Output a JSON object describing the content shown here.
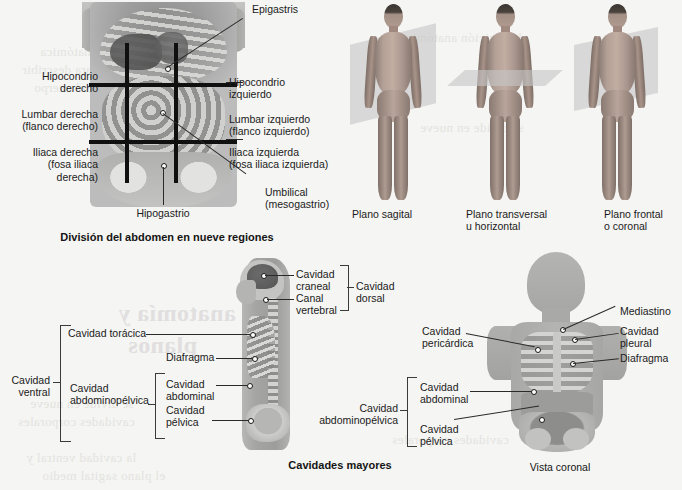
{
  "page": {
    "background_color": "#f5f5f3",
    "ghost_text": [
      "anatomía y",
      "planos",
      "la posición anatómica",
      "referencia para describir",
      "las regiones del cuerpo",
      "se divide en nueve",
      "cavidades corporales",
      "la cavidad ventral y",
      "el plano sagital medio"
    ]
  },
  "panel_abdomen": {
    "caption": "División del abdomen en nueve regiones",
    "labels": {
      "epigastris": "Epigastris",
      "hipocondrio_derecho": "Hipocondrio\nderecho",
      "lumbar_derecha": "Lumbar derecha\n(flanco derecho)",
      "iliaca_derecha": "Iliaca derecha\n(fosa iliaca\nderecha)",
      "hipocondrio_izquierdo": "Hipocondrio\nizquierdo",
      "lumbar_izquierdo": "Lumbar izquierdo\n(flanco izquierdo)",
      "iliaca_izquierda": "Iliaca izquierda\n(fosa iliaca izquierda)",
      "umbilical": "Umbilical\n(mesogastrio)",
      "hipogastrio": "Hipogastrio"
    }
  },
  "panel_planes": {
    "items": [
      {
        "label": "Plano sagital"
      },
      {
        "label": "Plano transversal\nu horizontal"
      },
      {
        "label": "Plano frontal\no coronal"
      }
    ]
  },
  "panel_cavities_lateral": {
    "caption": "Cavidades mayores",
    "labels": {
      "cavidad_ventral": "Cavidad\nventral",
      "cavidad_toracica": "Cavidad torácica",
      "cavidad_abdominopelvica": "Cavidad\nabdominopélvica",
      "diafragma": "Diafragma",
      "cavidad_abdominal": "Cavidad\nabdominal",
      "cavidad_pelvica": "Cavidad\npélvica",
      "cavidad_craneal": "Cavidad\ncraneal",
      "canal_vertebral": "Canal\nvertebral",
      "cavidad_dorsal": "Cavidad\ndorsal"
    }
  },
  "panel_cavities_coronal": {
    "caption": "Vista coronal",
    "labels": {
      "cavidad_abdominopelvica": "Cavidad\nabdominopélvica",
      "cavidad_pericardica": "Cavidad\npericárdica",
      "cavidad_abdominal": "Cavidad\nabdominal",
      "cavidad_pelvica": "Cavidad\npélvica",
      "mediastino": "Mediastino",
      "cavidad_pleural": "Cavidad\npleural",
      "diafragma": "Diafragma"
    }
  }
}
